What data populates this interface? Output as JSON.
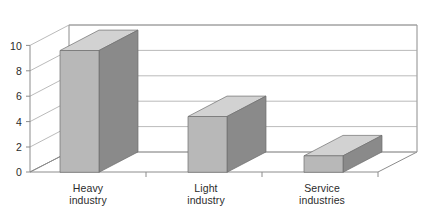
{
  "chart_data": {
    "type": "bar",
    "title": "",
    "subtitle": "",
    "xlabel": "",
    "ylabel": "",
    "categories": [
      "Heavy industry",
      "Light industry",
      "Service industries"
    ],
    "category_lines": [
      [
        "Heavy",
        "industry"
      ],
      [
        "Light",
        "industry"
      ],
      [
        "Service",
        "industries"
      ]
    ],
    "values": [
      9.6,
      4.4,
      1.3
    ],
    "ylim": [
      0,
      10
    ],
    "ytick_values": [
      0,
      2,
      4,
      6,
      8,
      10
    ],
    "ytick_labels": [
      "0",
      "2",
      "4",
      "6",
      "8",
      "10"
    ],
    "grid": true,
    "grid_axis": "y",
    "legend": false,
    "legend_position": "none",
    "three_d": true,
    "series": [
      {
        "name": "",
        "values": [
          9.6,
          4.4,
          1.3
        ]
      }
    ],
    "annotations": []
  },
  "style": {
    "bar_front_color": "#b8b8b8",
    "bar_side_color": "#8a8a8a",
    "bar_top_color": "#d2d2d2",
    "bar_edge_color": "#6e6e6e",
    "axis_color": "#8c8c8c",
    "grid_color": "#a8a8a8",
    "background_color": "#ffffff",
    "label_color": "#2b2b2b"
  }
}
